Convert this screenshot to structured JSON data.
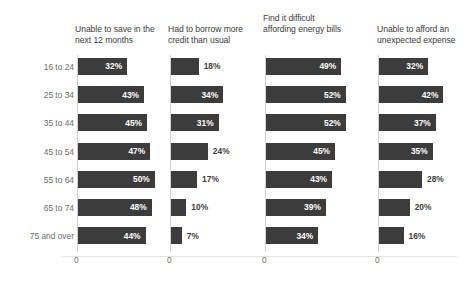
{
  "chart_data": {
    "type": "bar",
    "title": "",
    "subtitle": "",
    "xlabel": "",
    "ylabel": "",
    "orientation": "horizontal",
    "grid": false,
    "legend": false,
    "axis_tick_labels": [
      "0",
      "0",
      "0",
      "0"
    ],
    "axis_zero_label": "0",
    "xlim": [
      0,
      52
    ],
    "value_suffix": "%",
    "categories": [
      "16 to 24",
      "25 to 34",
      "35 to 44",
      "45 to 54",
      "55 to 64",
      "65 to 74",
      "75 and over"
    ],
    "series": [
      {
        "name": "Unable to save in the next 12 months",
        "values": [
          32,
          43,
          45,
          47,
          50,
          48,
          44
        ],
        "labels": [
          "32%",
          "43%",
          "45%",
          "47%",
          "50%",
          "48%",
          "44%"
        ],
        "label_position": [
          "inside",
          "inside",
          "inside",
          "inside",
          "inside",
          "inside",
          "inside"
        ]
      },
      {
        "name": "Had to borrow more credit than usual",
        "values": [
          18,
          34,
          31,
          24,
          17,
          10,
          7
        ],
        "labels": [
          "18%",
          "34%",
          "31%",
          "24%",
          "17%",
          "10%",
          "7%"
        ],
        "label_position": [
          "outside",
          "inside",
          "inside",
          "outside",
          "outside",
          "outside",
          "outside"
        ]
      },
      {
        "name": "Find it difficult affording energy bills",
        "values": [
          49,
          52,
          52,
          45,
          43,
          39,
          34
        ],
        "labels": [
          "49%",
          "52%",
          "52%",
          "45%",
          "43%",
          "39%",
          "34%"
        ],
        "label_position": [
          "inside",
          "inside",
          "inside",
          "inside",
          "inside",
          "inside",
          "inside"
        ]
      },
      {
        "name": "Unable to afford an unexpected expense",
        "values": [
          32,
          42,
          37,
          35,
          28,
          20,
          16
        ],
        "labels": [
          "32%",
          "42%",
          "37%",
          "35%",
          "28%",
          "20%",
          "16%"
        ],
        "label_position": [
          "inside",
          "inside",
          "inside",
          "inside",
          "outside",
          "outside",
          "outside"
        ]
      }
    ],
    "colors": {
      "bar": "#3c3c3c",
      "background": "#ffffff",
      "axis": "#d2d2d2",
      "category_text": "#6e6e6e",
      "title_text": "#3d3d3d",
      "value_inside_text": "#ffffff",
      "value_outside_text": "#3d3d3d"
    }
  },
  "panel_titles": [
    "Unable to save in the next 12 months",
    "Had to borrow more credit than usual",
    "Find it difficult affording energy bills",
    "Unable to afford an unexpected expense"
  ]
}
